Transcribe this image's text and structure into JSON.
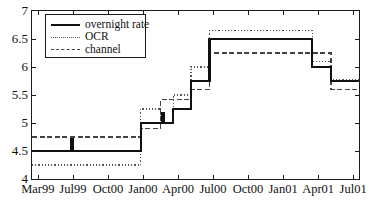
{
  "chart_data": {
    "type": "line",
    "title": "",
    "subtitle": "",
    "xlabel": "",
    "ylabel": "",
    "style": "step",
    "grid": false,
    "legend_position": "top-left",
    "ylim": [
      4,
      7
    ],
    "yticks": [
      4,
      4.5,
      5,
      5.5,
      6,
      6.5,
      7
    ],
    "ytick_labels": [
      "4",
      "4.5",
      "5",
      "5.5",
      "6",
      "6.5",
      "7"
    ],
    "xlim": [
      0,
      28
    ],
    "xticks": [
      0.5,
      3.5,
      6.5,
      9.5,
      12.5,
      15.5,
      18.5,
      21.5,
      24.5,
      27.5
    ],
    "xtick_labels": [
      "Mar99",
      "Jul99",
      "Oct00",
      "Jan00",
      "Apr00",
      "Jul00",
      "Oct00",
      "Jan01",
      "Apr01",
      "Jul01"
    ],
    "legend": [
      {
        "name": "overnight rate",
        "style": "solid",
        "color": "#111111",
        "width": 2.1
      },
      {
        "name": "OCR",
        "style": "dotted",
        "color": "#555555",
        "width": 1.4
      },
      {
        "name": "channel",
        "style": "dashed",
        "color": "#444444",
        "width": 1.3
      }
    ],
    "series": [
      {
        "name": "overnight rate",
        "style": "solid",
        "steps": [
          {
            "x": 0.0,
            "y": 4.5
          },
          {
            "x": 3.2,
            "y": 4.5
          },
          {
            "x": 3.35,
            "y": 4.72
          },
          {
            "x": 3.5,
            "y": 4.5
          },
          {
            "x": 9.3,
            "y": 4.5
          },
          {
            "x": 9.3,
            "y": 5.0
          },
          {
            "x": 11.0,
            "y": 5.0
          },
          {
            "x": 11.15,
            "y": 5.18
          },
          {
            "x": 11.3,
            "y": 5.0
          },
          {
            "x": 12.1,
            "y": 5.0
          },
          {
            "x": 12.1,
            "y": 5.25
          },
          {
            "x": 13.6,
            "y": 5.25
          },
          {
            "x": 13.6,
            "y": 5.75
          },
          {
            "x": 15.2,
            "y": 5.75
          },
          {
            "x": 15.2,
            "y": 6.5
          },
          {
            "x": 24.0,
            "y": 6.5
          },
          {
            "x": 24.0,
            "y": 6.0
          },
          {
            "x": 25.6,
            "y": 6.0
          },
          {
            "x": 25.6,
            "y": 5.75
          },
          {
            "x": 28.0,
            "y": 5.75
          }
        ]
      },
      {
        "name": "OCR",
        "style": "dotted",
        "steps": [
          {
            "x": 0.0,
            "y": 4.25
          },
          {
            "x": 9.3,
            "y": 4.25
          },
          {
            "x": 9.3,
            "y": 5.25
          },
          {
            "x": 11.0,
            "y": 5.25
          },
          {
            "x": 11.0,
            "y": 5.0
          },
          {
            "x": 12.1,
            "y": 5.0
          },
          {
            "x": 12.1,
            "y": 5.5
          },
          {
            "x": 13.6,
            "y": 5.5
          },
          {
            "x": 13.6,
            "y": 6.0
          },
          {
            "x": 15.2,
            "y": 6.0
          },
          {
            "x": 15.2,
            "y": 6.65
          },
          {
            "x": 24.0,
            "y": 6.65
          },
          {
            "x": 24.0,
            "y": 6.1
          },
          {
            "x": 25.6,
            "y": 6.1
          },
          {
            "x": 25.6,
            "y": 5.78
          },
          {
            "x": 28.0,
            "y": 5.78
          }
        ]
      },
      {
        "name": "channel",
        "style": "dashed",
        "steps": [
          {
            "x": 0.0,
            "y": 4.75
          },
          {
            "x": 9.3,
            "y": 4.75
          },
          {
            "x": 9.3,
            "y": 4.9
          },
          {
            "x": 11.0,
            "y": 4.9
          },
          {
            "x": 11.0,
            "y": 5.42
          },
          {
            "x": 12.1,
            "y": 5.42
          },
          {
            "x": 12.1,
            "y": 5.42
          },
          {
            "x": 13.6,
            "y": 5.42
          },
          {
            "x": 13.6,
            "y": 5.6
          },
          {
            "x": 15.2,
            "y": 5.6
          },
          {
            "x": 15.2,
            "y": 6.25
          },
          {
            "x": 24.0,
            "y": 6.25
          },
          {
            "x": 24.0,
            "y": 6.25
          },
          {
            "x": 25.6,
            "y": 6.25
          },
          {
            "x": 25.6,
            "y": 5.6
          },
          {
            "x": 28.0,
            "y": 5.6
          }
        ]
      }
    ]
  },
  "axes": {
    "y_min": 4,
    "y_max": 7,
    "x_min": 0,
    "x_max": 28
  }
}
